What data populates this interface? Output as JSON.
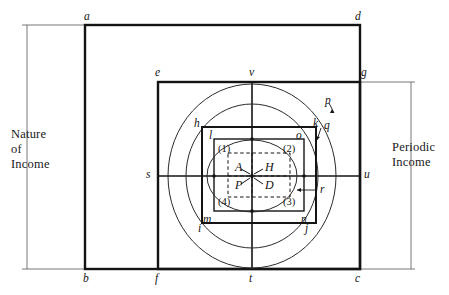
{
  "figure": {
    "background_color": "#ffffff",
    "stroke_color": "#1a1a1a"
  },
  "axis_labels": {
    "left": "Nature\nof\nIncome",
    "right": "Periodic\nIncome"
  },
  "corner_points": {
    "a": "a",
    "b": "b",
    "c": "c",
    "d": "d",
    "e": "e",
    "f": "f",
    "g": "g"
  },
  "axis_points": {
    "s": "s",
    "t": "t",
    "u": "u",
    "v": "v"
  },
  "rect_points": {
    "h": "h",
    "k": "k",
    "m": "m",
    "n": "n",
    "l": "l",
    "o": "o"
  },
  "circle_points": {
    "i": "i",
    "j": "j"
  },
  "leader_labels": {
    "p": "p",
    "q": "q",
    "r": "r"
  },
  "quadrants": {
    "q1": "(1)",
    "q2": "(2)",
    "q3": "(3)",
    "q4": "(4)"
  },
  "core_cells": {
    "A": "A",
    "H": "H",
    "P": "P",
    "D": "D"
  },
  "geometry": {
    "outer_rect": {
      "x": 85,
      "y": 25,
      "w": 275,
      "h": 244
    },
    "mid_rect": {
      "x": 158,
      "y": 82,
      "w": 202,
      "h": 187
    },
    "bold_inner_rect": {
      "x": 202,
      "y": 127,
      "w": 114,
      "h": 96
    },
    "inner_rect": {
      "x": 214,
      "y": 139,
      "w": 90,
      "h": 72
    },
    "dashed_rect": {
      "x": 228,
      "y": 153,
      "w": 62,
      "h": 44
    },
    "center": {
      "x": 252,
      "y": 176
    },
    "outer_ellipse": {
      "cx": 252,
      "cy": 176,
      "rx": 84,
      "ry": 92
    },
    "mid_ellipse": {
      "cx": 252,
      "cy": 176,
      "rx": 66,
      "ry": 72
    },
    "small_ellipse": {
      "cx": 252,
      "cy": 176,
      "rx": 45,
      "ry": 36
    }
  }
}
